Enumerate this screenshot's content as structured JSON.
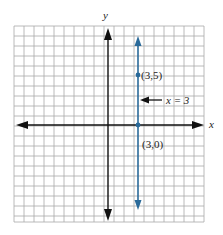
{
  "diagram": {
    "type": "coordinate-plane",
    "axis_labels": {
      "x": "x",
      "y": "y"
    },
    "line": {
      "equation_label": "x = 3",
      "color": "#2a6a9a"
    },
    "points": [
      {
        "label": "(3,5)",
        "x": 3,
        "y": 5
      },
      {
        "label": "(3,0)",
        "x": 3,
        "y": 0
      }
    ],
    "grid_color": "#9a9a9a",
    "axis_color": "#111111"
  }
}
